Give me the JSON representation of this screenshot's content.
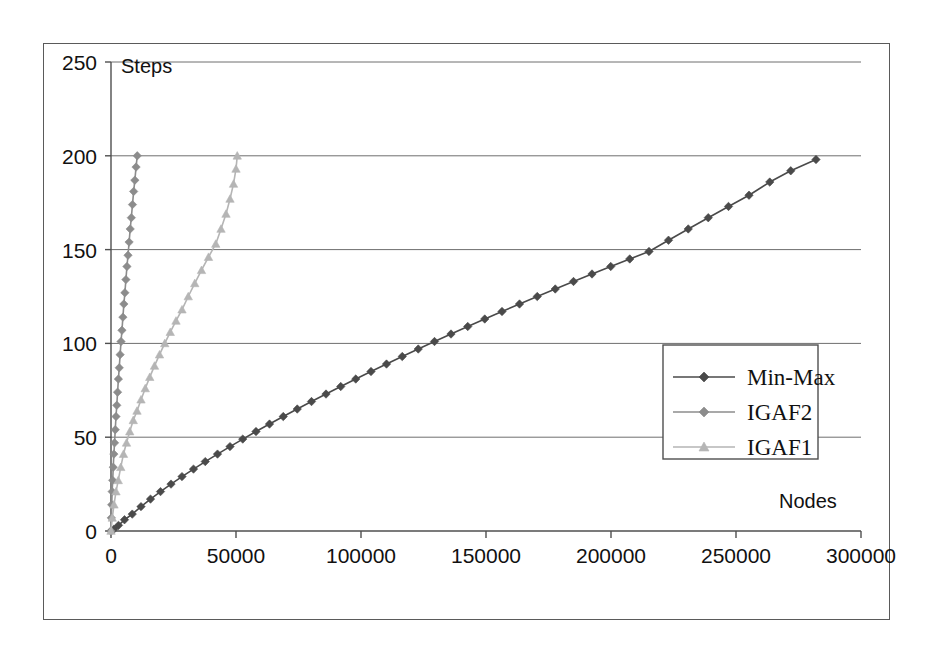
{
  "chart_data": {
    "type": "line",
    "title": "",
    "xlabel": "Nodes",
    "ylabel": "Steps",
    "xlim": [
      0,
      300000
    ],
    "ylim": [
      0,
      250
    ],
    "xticks": [
      0,
      50000,
      100000,
      150000,
      200000,
      250000,
      300000
    ],
    "yticks": [
      0,
      50,
      100,
      150,
      200,
      250
    ],
    "xtick_labels": [
      "0",
      "50000",
      "100000",
      "150000",
      "200000",
      "250000",
      "300000"
    ],
    "ytick_labels": [
      "0",
      "50",
      "100",
      "150",
      "200",
      "250"
    ],
    "grid": {
      "horizontal": true,
      "vertical": false
    },
    "legend": {
      "position": "center-right"
    },
    "series": [
      {
        "name": "Min-Max",
        "color": "#4a4a4a",
        "marker": "diamond",
        "x": [
          0,
          1200,
          3000,
          5400,
          8500,
          12000,
          15800,
          19800,
          24000,
          28400,
          33000,
          37700,
          42600,
          47600,
          52700,
          58000,
          63400,
          68900,
          74500,
          80200,
          86000,
          91900,
          97900,
          104000,
          110200,
          116500,
          122900,
          129400,
          136000,
          142700,
          149500,
          156400,
          163400,
          170500,
          177700,
          185000,
          192400,
          199900,
          207500,
          215200,
          223000,
          230900,
          238900,
          247000,
          255200,
          263500,
          271900,
          282000
        ],
        "y": [
          0,
          1,
          3,
          6,
          9,
          13,
          17,
          21,
          25,
          29,
          33,
          37,
          41,
          45,
          49,
          53,
          57,
          61,
          65,
          69,
          73,
          77,
          81,
          85,
          89,
          93,
          97,
          101,
          105,
          109,
          113,
          117,
          121,
          125,
          129,
          133,
          137,
          141,
          145,
          149,
          155,
          161,
          167,
          173,
          179,
          186,
          192,
          198
        ]
      },
      {
        "name": "IGAF2",
        "color": "#8c8c8c",
        "marker": "diamond",
        "x": [
          0,
          120,
          280,
          460,
          670,
          900,
          1150,
          1420,
          1700,
          2000,
          2310,
          2630,
          2960,
          3300,
          3650,
          4010,
          4380,
          4760,
          5150,
          5550,
          5960,
          6380,
          6800,
          7240,
          7680,
          8130,
          8590,
          9060,
          9540,
          10030,
          10500
        ],
        "y": [
          0,
          7,
          14,
          21,
          27,
          34,
          41,
          47,
          54,
          61,
          67,
          74,
          81,
          87,
          94,
          101,
          107,
          114,
          121,
          127,
          134,
          141,
          147,
          154,
          161,
          167,
          174,
          181,
          187,
          194,
          200
        ]
      },
      {
        "name": "IGAF1",
        "color": "#b5b5b5",
        "marker": "triangle",
        "x": [
          0,
          500,
          1200,
          2000,
          2900,
          3900,
          5000,
          6200,
          7500,
          8900,
          10400,
          12000,
          13700,
          15500,
          17400,
          19400,
          21500,
          23700,
          26000,
          28400,
          30900,
          33500,
          36200,
          39000,
          41900,
          44000,
          46000,
          47600,
          49000,
          50000,
          50500
        ],
        "y": [
          0,
          7,
          14,
          21,
          27,
          34,
          41,
          47,
          53,
          59,
          64,
          70,
          76,
          82,
          88,
          94,
          100,
          106,
          112,
          118,
          125,
          132,
          139,
          146,
          153,
          161,
          169,
          177,
          185,
          193,
          200
        ]
      }
    ]
  },
  "axes": {
    "y_title": "Steps",
    "x_title": "Nodes"
  },
  "legend_entries": [
    {
      "label": "Min-Max"
    },
    {
      "label": "IGAF2"
    },
    {
      "label": "IGAF1"
    }
  ]
}
